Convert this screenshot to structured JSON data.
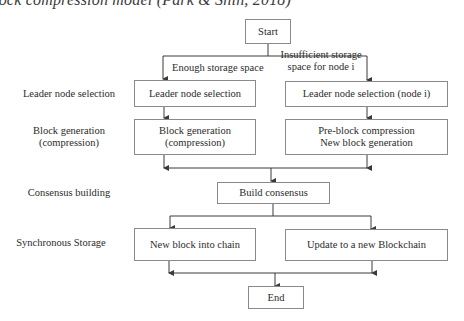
{
  "caption": "lock compression model (Park & Shin, 2018)",
  "colors": {
    "line": "#3a3a3a",
    "box_border": "#8a8a8a",
    "text": "#2b2b2b",
    "background": "#ffffff"
  },
  "nodes": {
    "start": "Start",
    "end": "End",
    "build_consensus": "Build consensus",
    "left_leader": "Leader node selection",
    "left_block_line1": "Block generation",
    "left_block_line2": "(compression)",
    "right_leader": "Leader node selection (node i)",
    "right_block_line1": "Pre-block compression",
    "right_block_line2": "New block generation",
    "left_storage": "New block into chain",
    "right_storage": "Update to a new Blockchain"
  },
  "branches": {
    "left": "Enough storage space",
    "right_line1": "Insufficient storage",
    "right_line2": "space for node i"
  },
  "stages": [
    {
      "line1": "Leader node selection",
      "line2": ""
    },
    {
      "line1": "Block generation",
      "line2": "(compression)"
    },
    {
      "line1": "Consensus building",
      "line2": ""
    },
    {
      "line1": "Synchronous Storage",
      "line2": ""
    }
  ]
}
